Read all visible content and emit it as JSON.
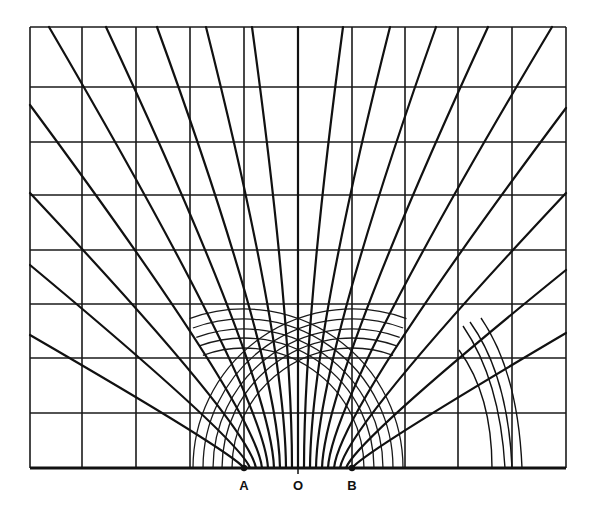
{
  "figure": {
    "title": "",
    "labels": [
      {
        "id": "A",
        "text": "A",
        "x": 244,
        "y": 480
      },
      {
        "id": "O",
        "text": "O",
        "x": 298,
        "y": 480
      },
      {
        "id": "B",
        "text": "B",
        "x": 352,
        "y": 480
      }
    ],
    "points": {
      "A": {
        "x": 244,
        "y": 468
      },
      "O": {
        "x": 298,
        "y": 468
      },
      "B": {
        "x": 352,
        "y": 468
      }
    },
    "grid": {
      "x": [
        30,
        82,
        136,
        190,
        244,
        298,
        352,
        405,
        458,
        512,
        566
      ],
      "y": [
        27,
        87,
        142,
        195,
        250,
        304,
        358,
        413,
        468
      ]
    },
    "field_lines": [
      {
        "from": [
          244,
          468
        ],
        "ctrl": [
          232,
          452
        ],
        "to": [
          30,
          335
        ]
      },
      {
        "from": [
          250,
          468
        ],
        "ctrl": [
          240,
          440
        ],
        "to": [
          30,
          265
        ]
      },
      {
        "from": [
          256,
          468
        ],
        "ctrl": [
          248,
          425
        ],
        "to": [
          30,
          193
        ]
      },
      {
        "from": [
          262,
          468
        ],
        "ctrl": [
          256,
          410
        ],
        "to": [
          30,
          105
        ]
      },
      {
        "from": [
          268,
          468
        ],
        "ctrl": [
          264,
          395
        ],
        "to": [
          49,
          27
        ]
      },
      {
        "from": [
          274,
          468
        ],
        "ctrl": [
          271,
          380
        ],
        "to": [
          106,
          27
        ]
      },
      {
        "from": [
          280,
          468
        ],
        "ctrl": [
          278,
          360
        ],
        "to": [
          157,
          27
        ]
      },
      {
        "from": [
          286,
          468
        ],
        "ctrl": [
          285,
          340
        ],
        "to": [
          206,
          27
        ]
      },
      {
        "from": [
          292,
          468
        ],
        "ctrl": [
          292,
          320
        ],
        "to": [
          252,
          27
        ]
      },
      {
        "from": [
          298,
          468
        ],
        "ctrl": [
          298,
          250
        ],
        "to": [
          298,
          27
        ]
      },
      {
        "from": [
          304,
          468
        ],
        "ctrl": [
          304,
          320
        ],
        "to": [
          343,
          27
        ]
      },
      {
        "from": [
          310,
          468
        ],
        "ctrl": [
          311,
          340
        ],
        "to": [
          390,
          27
        ]
      },
      {
        "from": [
          316,
          468
        ],
        "ctrl": [
          318,
          360
        ],
        "to": [
          436,
          27
        ]
      },
      {
        "from": [
          322,
          468
        ],
        "ctrl": [
          325,
          380
        ],
        "to": [
          488,
          27
        ]
      },
      {
        "from": [
          328,
          468
        ],
        "ctrl": [
          332,
          395
        ],
        "to": [
          552,
          27
        ]
      },
      {
        "from": [
          334,
          468
        ],
        "ctrl": [
          340,
          410
        ],
        "to": [
          566,
          108
        ]
      },
      {
        "from": [
          340,
          468
        ],
        "ctrl": [
          348,
          425
        ],
        "to": [
          566,
          193
        ]
      },
      {
        "from": [
          346,
          468
        ],
        "ctrl": [
          356,
          440
        ],
        "to": [
          566,
          270
        ]
      },
      {
        "from": [
          352,
          468
        ],
        "ctrl": [
          364,
          452
        ],
        "to": [
          566,
          333
        ]
      }
    ],
    "arcs_centered_B": {
      "cx": 352,
      "cy": 468,
      "radii": [
        120,
        130,
        139,
        149,
        159
      ]
    },
    "arcs_centered_A": {
      "cx": 244,
      "cy": 468,
      "radii": [
        120,
        130,
        139,
        149,
        159
      ]
    },
    "small_arcs": [
      {
        "d": "M 463 326 Q 500 380 505 468"
      },
      {
        "d": "M 470 322 Q 508 375 512 468"
      },
      {
        "d": "M 481 318 Q 518 372 522 468"
      },
      {
        "d": "M 459 350 Q 492 395 492 468"
      }
    ]
  }
}
